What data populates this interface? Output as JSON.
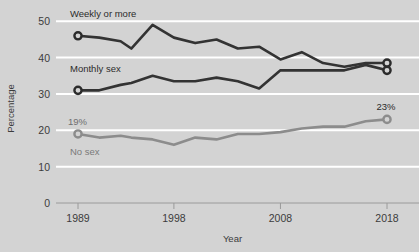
{
  "chart_data": {
    "type": "line",
    "title": "",
    "xlabel": "Year",
    "ylabel": "Percentage",
    "xlim": [
      1989,
      2018
    ],
    "ylim": [
      0,
      52
    ],
    "grid": true,
    "gridlines_y": [
      10,
      20,
      30,
      40,
      50
    ],
    "xticks": [
      1989,
      1998,
      2008,
      2018
    ],
    "xtick_labels": [
      "1989",
      "1998",
      "2008",
      "2018"
    ],
    "yticks": [
      0,
      10,
      20,
      30,
      40,
      50
    ],
    "ytick_labels": [
      "0",
      "10",
      "20",
      "30",
      "40",
      "50"
    ],
    "legend_position": "inline-labels",
    "series": [
      {
        "name": "Weekly or more",
        "color": "#333333",
        "label": "Weekly or more",
        "x": [
          1989,
          1991,
          1993,
          1994,
          1996,
          1998,
          2000,
          2002,
          2004,
          2006,
          2008,
          2010,
          2012,
          2014,
          2016,
          2018
        ],
        "values": [
          46,
          45.5,
          44.5,
          42.5,
          49,
          45.5,
          44,
          45,
          42.5,
          43,
          39.5,
          41.5,
          38.5,
          37.5,
          38.5,
          38.5
        ],
        "start_marker": true,
        "end_marker": true
      },
      {
        "name": "Monthly sex",
        "color": "#333333",
        "label": "Monthly sex",
        "x": [
          1989,
          1991,
          1993,
          1994,
          1996,
          1998,
          2000,
          2002,
          2004,
          2006,
          2008,
          2010,
          2012,
          2014,
          2016,
          2018
        ],
        "values": [
          31,
          31,
          32.5,
          33,
          35,
          33.5,
          33.5,
          34.5,
          33.5,
          31.5,
          36.5,
          36.5,
          36.5,
          36.5,
          38,
          36.5
        ],
        "start_marker": true,
        "end_marker": true
      },
      {
        "name": "No sex",
        "color": "#8c8c8c",
        "label": "No sex",
        "x": [
          1989,
          1991,
          1993,
          1994,
          1996,
          1998,
          2000,
          2002,
          2004,
          2006,
          2008,
          2010,
          2012,
          2014,
          2016,
          2018
        ],
        "values": [
          19,
          18,
          18.5,
          18,
          17.5,
          16,
          18,
          17.5,
          19,
          19,
          19.5,
          20.5,
          21,
          21,
          22.5,
          23
        ],
        "start_marker": true,
        "end_marker": true
      }
    ],
    "annotations": [
      {
        "text": "19%",
        "series": "No sex",
        "position": "start-above"
      },
      {
        "text": "23%",
        "series": "No sex",
        "position": "end-above"
      }
    ]
  }
}
